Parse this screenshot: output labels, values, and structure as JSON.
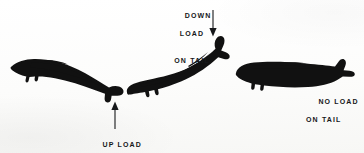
{
  "figure": {
    "background_color": "#fbfbfa",
    "ink_color": "#16181a",
    "silhouette_color": "#111111"
  },
  "annotations": [
    {
      "id": "down-load",
      "line1": "DOWN",
      "line2": "LOAD",
      "line3": "ON TAIL",
      "text": "DOWN LOAD ON TAIL",
      "arrow_direction": "down",
      "points_to": "tail-of-climbing-aircraft"
    },
    {
      "id": "up-load",
      "line1": "UP LOAD",
      "line2": "ON TAIL",
      "text": "UP LOAD ON TAIL",
      "arrow_direction": "up",
      "points_to": "tail-of-diving-aircraft"
    },
    {
      "id": "no-load",
      "line1": "NO LOAD",
      "line2": "ON TAIL",
      "text": "NO LOAD ON TAIL",
      "arrow_direction": "none",
      "points_to": "tail-of-level-aircraft"
    }
  ],
  "aircraft": [
    {
      "id": "diving-aircraft",
      "attitude": "nose-down / diving",
      "rotation_degrees": 12,
      "label": "UP LOAD ON TAIL",
      "position": "left"
    },
    {
      "id": "climbing-aircraft",
      "attitude": "nose-up / climbing",
      "rotation_degrees": -25,
      "label": "DOWN LOAD ON TAIL",
      "position": "center"
    },
    {
      "id": "level-aircraft",
      "attitude": "level flight",
      "rotation_degrees": 0,
      "label": "NO LOAD ON TAIL",
      "position": "right"
    }
  ]
}
